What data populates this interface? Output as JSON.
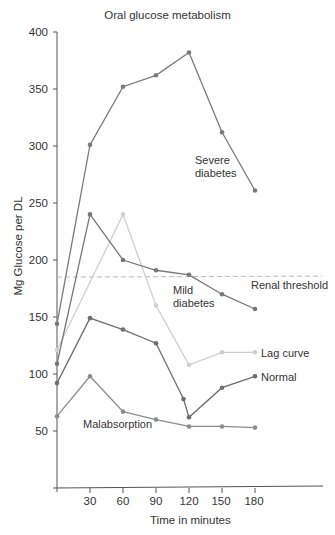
{
  "chart_data": {
    "type": "line",
    "title": "Oral glucose metabolism",
    "xlabel": "Time in minutes",
    "ylabel": "Mg Glucose per DL",
    "xlim": [
      0,
      240
    ],
    "ylim": [
      0,
      400
    ],
    "x_ticks": [
      30,
      60,
      90,
      120,
      150,
      180
    ],
    "y_ticks": [
      50,
      100,
      150,
      200,
      250,
      300,
      350,
      400
    ],
    "grid": false,
    "legend": "inline labels",
    "reference_lines": [
      {
        "name": "Renal threshold",
        "y": 185,
        "style": "dashed",
        "color": "#bbbbbb"
      }
    ],
    "series": [
      {
        "name": "Severe diabetes",
        "label": [
          "Severe",
          "diabetes"
        ],
        "color": "#7a7a7a",
        "x": [
          0,
          30,
          60,
          90,
          120,
          150,
          180
        ],
        "values": [
          144,
          301,
          352,
          362,
          382,
          312,
          261
        ]
      },
      {
        "name": "Mild diabetes",
        "label": [
          "Mild",
          "diabetes"
        ],
        "color": "#777777",
        "x": [
          0,
          30,
          60,
          90,
          120,
          150,
          180
        ],
        "values": [
          109,
          240,
          200,
          191,
          187,
          170,
          157
        ]
      },
      {
        "name": "Lag curve",
        "label": [
          "Lag curve"
        ],
        "color": "#cfcfcf",
        "x": [
          0,
          60,
          90,
          120,
          150,
          180
        ],
        "values": [
          121,
          240,
          160,
          108,
          119,
          119
        ]
      },
      {
        "name": "Normal",
        "label": [
          "Normal"
        ],
        "color": "#6e6e6e",
        "x": [
          0,
          30,
          60,
          90,
          115,
          120,
          150,
          180
        ],
        "values": [
          92,
          149,
          139,
          127,
          78,
          62,
          88,
          98
        ]
      },
      {
        "name": "Malabsorption",
        "label": [
          "Malabsorption"
        ],
        "color": "#8c8c8c",
        "x": [
          0,
          30,
          60,
          90,
          120,
          150,
          180
        ],
        "values": [
          63,
          98,
          67,
          60,
          54,
          54,
          53
        ]
      }
    ]
  },
  "labels": {
    "title": "Oral glucose metabolism",
    "xlabel": "Time in minutes",
    "ylabel": "Mg Glucose per DL",
    "renal": "Renal threshold",
    "severe1": "Severe",
    "severe2": "diabetes",
    "mild1": "Mild",
    "mild2": "diabetes",
    "lag": "Lag curve",
    "normal": "Normal",
    "malabsorption": "Malabsorption"
  },
  "ticks": {
    "y": [
      "400",
      "350",
      "300",
      "250",
      "200",
      "150",
      "100",
      "50"
    ],
    "x": [
      "30",
      "60",
      "90",
      "120",
      "150",
      "180"
    ]
  }
}
